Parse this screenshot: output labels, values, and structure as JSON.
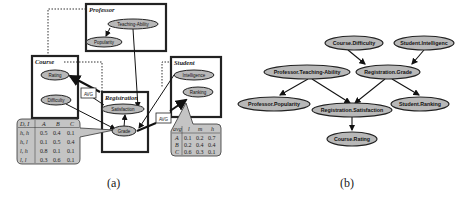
{
  "panel_a": {
    "caption": "(a)",
    "classes": {
      "professor": {
        "label": "Professor",
        "attrs": [
          "Teaching-Ability",
          "Popularity"
        ]
      },
      "course": {
        "label": "Course",
        "attrs": [
          "Rating",
          "Difficulty"
        ]
      },
      "registration": {
        "label": "Registration",
        "attrs": [
          "Satisfaction",
          "Grade"
        ]
      },
      "student": {
        "label": "Student",
        "attrs": [
          "Intelligence",
          "Ranking"
        ]
      }
    },
    "agg_labels": [
      "AVG",
      "AVG"
    ],
    "grade_cpt": {
      "header": [
        "D, I",
        "A",
        "B",
        "C"
      ],
      "rows": [
        [
          "h, h",
          "0.5",
          "0.4",
          "0.1"
        ],
        [
          "h, l",
          "0.1",
          "0.5",
          "0.4"
        ],
        [
          "l, h",
          "0.8",
          "0.1",
          "0.1"
        ],
        [
          "l, l",
          "0.3",
          "0.6",
          "0.1"
        ]
      ]
    },
    "ranking_cpt": {
      "header": [
        "avg",
        "l",
        "m",
        "h"
      ],
      "rows": [
        [
          "A",
          "0.1",
          "0.2",
          "0.7"
        ],
        [
          "B",
          "0.2",
          "0.4",
          "0.4"
        ],
        [
          "C",
          "0.6",
          "0.3",
          "0.1"
        ]
      ]
    }
  },
  "panel_b": {
    "caption": "(b)",
    "nodes": [
      "Course.Difficulty",
      "Student.Intelligenc",
      "Professor.Teaching-Ability",
      "Registration.Grade",
      "Professor.Popularity",
      "Registration.Satisfaction",
      "Student.Ranking",
      "Course.Rating"
    ]
  },
  "colors": {
    "node_fill": "#b8b8b8",
    "box_stroke": "#222222",
    "cpt_fill": "#c4c4c4"
  }
}
